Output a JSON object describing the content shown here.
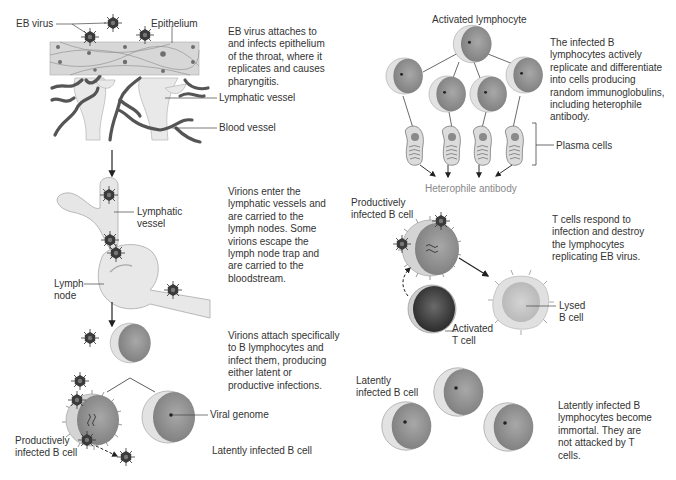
{
  "diagram": {
    "colors": {
      "epithelium": "#d9d9d9",
      "vessel_fill": "#e8e8e8",
      "blood_vessel": "#555555",
      "cell_body": "#9a9a9a",
      "cell_crescent": "#dedede",
      "virus": "#333333",
      "t_cell": "#3a3a3a",
      "lysed_cell": "#cfcfcf"
    },
    "step1": {
      "labels": {
        "eb_virus": "EB virus",
        "epithelium": "Epithelium",
        "lymphatic_vessel": "Lymphatic vessel",
        "blood_vessel": "Blood vessel"
      },
      "description": "EB virus attaches to and infects epithelium of the throat, where it replicates and causes pharyngitis."
    },
    "step2": {
      "labels": {
        "lymphatic_vessel": "Lymphatic vessel",
        "lymph_node": "Lymph node"
      },
      "description": "Virions enter the lymphatic vessels and are carried to the lymph nodes. Some virions escape the lymph node trap and are carried to the bloodstream."
    },
    "step3": {
      "labels": {
        "productively_infected": "Productively infected B cell",
        "viral_genome": "Viral genome",
        "latently_infected": "Latently infected B cell"
      },
      "description": "Virions attach specifically to B lymphocytes and infect them, producing either latent or productive infections."
    },
    "step4": {
      "labels": {
        "activated_lymphocyte": "Activated lymphocyte",
        "plasma_cells": "Plasma cells",
        "heterophile_antibody": "Heterophile antibody"
      },
      "description": "The infected B lymphocytes actively replicate and differentiate into cells producing random immunoglobulins, including heterophile antibody."
    },
    "step5": {
      "labels": {
        "productively_infected": "Productively infected B cell",
        "activated_t_cell": "Activated T cell",
        "lysed_b_cell": "Lysed B cell"
      },
      "description": "T cells respond to infection and destroy the lymphocytes replicating EB virus."
    },
    "step6": {
      "labels": {
        "latently_infected": "Latently infected B cell"
      },
      "description": "Latently infected B lymphocytes become immortal. They are not attacked by T cells."
    }
  }
}
